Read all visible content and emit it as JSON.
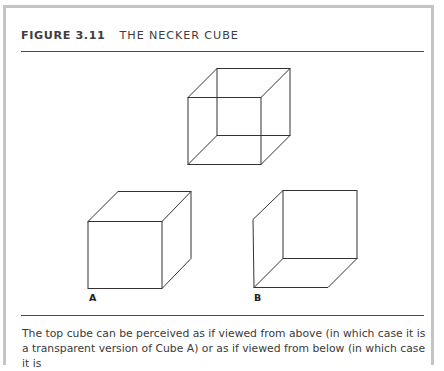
{
  "figure": {
    "number": "FIGURE 3.11",
    "title": "THE NECKER CUBE",
    "labels": {
      "cube_a": "A",
      "cube_b": "B"
    },
    "caption": "The top cube can be perceived as if viewed from above (in which case it is a transparent version of Cube A) or as if viewed from below (in which case it is",
    "colors": {
      "frame": "#c4c4c4",
      "rule": "#4a4a4a",
      "line": "#333333",
      "text": "#3a3a3a"
    }
  }
}
